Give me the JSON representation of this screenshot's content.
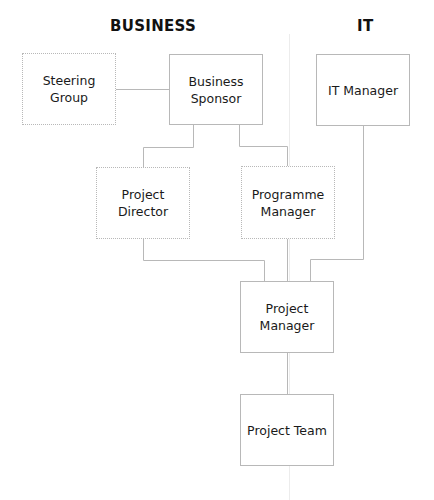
{
  "diagram": {
    "top_fragment": "...y ... ...y ...g...",
    "columns": [
      {
        "id": "business",
        "label": "BUSINESS"
      },
      {
        "id": "it",
        "label": "IT"
      }
    ],
    "nodes": {
      "steering_group": {
        "label": "Steering Group",
        "column": "business",
        "border": "dotted"
      },
      "business_sponsor": {
        "label": "Business Sponsor",
        "column": "business",
        "border": "solid"
      },
      "it_manager": {
        "label": "IT Manager",
        "column": "it",
        "border": "solid"
      },
      "project_director": {
        "label": "Project Director",
        "column": "business",
        "border": "dotted"
      },
      "programme_manager": {
        "label": "Programme Manager",
        "column": "business",
        "border": "dotted"
      },
      "project_manager": {
        "label": "Project Manager",
        "column": "business",
        "border": "solid"
      },
      "project_team": {
        "label": "Project Team",
        "column": "business",
        "border": "solid"
      }
    },
    "edges": [
      {
        "from": "steering_group",
        "to": "business_sponsor"
      },
      {
        "from": "business_sponsor",
        "to": "project_director"
      },
      {
        "from": "business_sponsor",
        "to": "programme_manager"
      },
      {
        "from": "project_director",
        "to": "project_manager"
      },
      {
        "from": "programme_manager",
        "to": "project_manager"
      },
      {
        "from": "it_manager",
        "to": "project_manager"
      },
      {
        "from": "project_manager",
        "to": "project_team"
      }
    ],
    "colors": {
      "line": "#b8b8b8",
      "text": "#1a1a1a",
      "heading": "#111111",
      "divider": "#ececec",
      "background": "#ffffff"
    }
  }
}
